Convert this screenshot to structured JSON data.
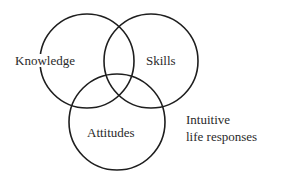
{
  "diagram": {
    "type": "venn",
    "circles": [
      {
        "id": "knowledge",
        "label": "Knowledge",
        "cx": 87,
        "cy": 61,
        "r": 47
      },
      {
        "id": "skills",
        "label": "Skills",
        "cx": 151,
        "cy": 61,
        "r": 47
      },
      {
        "id": "attitudes",
        "label": "Attitudes",
        "cx": 117,
        "cy": 122,
        "r": 48
      }
    ],
    "outside_label": {
      "line1": "Intuitive",
      "line2": "life responses"
    },
    "stroke_color": "#1e1e1e",
    "text_color": "#2a2a2a"
  }
}
